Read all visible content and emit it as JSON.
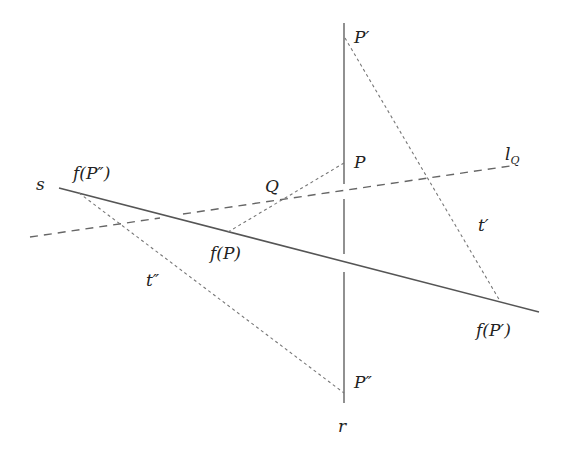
{
  "diagram": {
    "colors": {
      "solid_line": "#555555",
      "dashed_line": "#666666",
      "dotted_line": "#777777",
      "text": "#222222"
    },
    "lines": {
      "r": {
        "name": "r",
        "style": "solid",
        "from": [
          344,
          23
        ],
        "to": [
          344,
          403
        ],
        "gaps": [
          [
            184,
            199
          ],
          [
            254,
            272
          ]
        ]
      },
      "s": {
        "name": "s",
        "style": "solid",
        "from": [
          59,
          188
        ],
        "to": [
          539,
          312
        ]
      },
      "l_Q": {
        "name": "l_Q",
        "style": "dashed",
        "from": [
          30,
          237
        ],
        "to": [
          510,
          166
        ],
        "gap_x": [
          160,
          183
        ]
      },
      "t_prime": {
        "name": "t'",
        "style": "dotted",
        "from": [
          345,
          38
        ],
        "to": [
          500,
          301
        ]
      },
      "t_double_prime": {
        "name": "t''",
        "style": "dotted",
        "from": [
          79,
          193
        ],
        "to": [
          344,
          393
        ]
      },
      "P_fP": {
        "name": "P-f(P)",
        "style": "dotted",
        "from": [
          228,
          232
        ],
        "to": [
          344,
          163
        ]
      }
    },
    "points": {
      "P": [
        344,
        163
      ],
      "P_prime": [
        344,
        38
      ],
      "P_double_prime": [
        344,
        393
      ],
      "f_P": [
        228,
        232
      ],
      "f_P_prime": [
        500,
        301
      ],
      "f_P_double_prime": [
        79,
        193
      ],
      "Q": [
        283,
        199
      ]
    },
    "labels": {
      "s": "s",
      "r": "r",
      "l": "l",
      "l_sub": "Q",
      "P": "P",
      "P_prime": "P′",
      "P_double_prime": "P″",
      "Q": "Q",
      "f_P": "f(P)",
      "f_P_prime": "f(P′)",
      "f_P_double_prime": "f(P″)",
      "t_prime": "t′",
      "t_double_prime": "t″"
    }
  }
}
